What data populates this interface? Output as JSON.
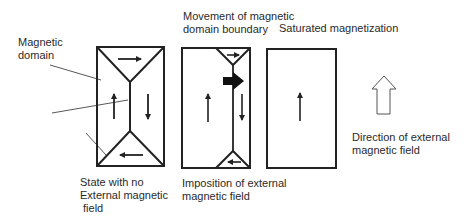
{
  "labels": {
    "magnetic_domain": "Magnetic\ndomain",
    "movement_boundary": "Movement of magnetic\ndomain boundary",
    "saturated": "Saturated magnetization",
    "state_no_field": "State with no\nExternal magnetic\n field",
    "imposition": "Imposition of external\nmagnetic field",
    "direction": "Direction of external\nmagnetic field"
  },
  "panels": [
    {
      "name": "no-field-state",
      "domains": [
        "top: right",
        "left: up",
        "right: down",
        "bottom: left"
      ]
    },
    {
      "name": "field-imposed-state",
      "domains": [
        "top: right (small)",
        "left: up (large)",
        "right: down",
        "bottom: left (small)"
      ],
      "boundary_motion": "right"
    },
    {
      "name": "saturated-state",
      "domains": [
        "single: up"
      ]
    }
  ],
  "colors": {
    "line": "#222222",
    "text": "#2a2a2a",
    "background": "#ffffff"
  }
}
